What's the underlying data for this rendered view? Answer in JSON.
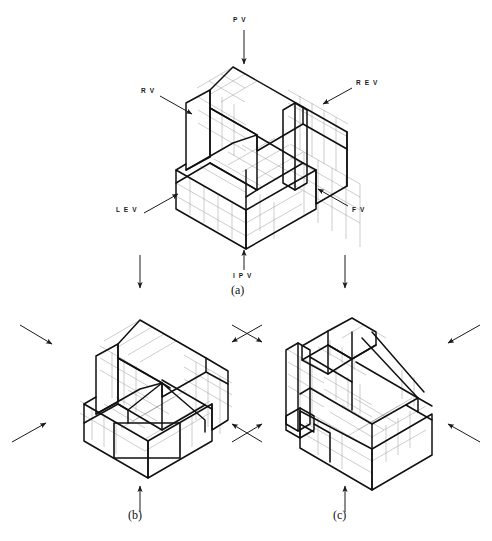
{
  "figure": {
    "background_color": "#ffffff",
    "line_color": "#1a1a1a",
    "grid_color": "#9a9a9a",
    "panels": [
      {
        "id": "panel-a",
        "caption": "(a)",
        "arrows": [
          {
            "name": "pv",
            "label": "P V",
            "direction": "down",
            "label_position": "top-center"
          },
          {
            "name": "rv",
            "label": "R V",
            "direction": "down-right",
            "label_position": "upper-left"
          },
          {
            "name": "rev",
            "label": "R E V",
            "direction": "down-left",
            "label_position": "upper-right"
          },
          {
            "name": "lev",
            "label": "L E V",
            "direction": "up-right",
            "label_position": "lower-left"
          },
          {
            "name": "fv",
            "label": "F V",
            "direction": "up-left",
            "label_position": "lower-right"
          },
          {
            "name": "ipv",
            "label": "I P V",
            "direction": "up",
            "label_position": "bottom-center"
          }
        ]
      },
      {
        "id": "panel-b",
        "caption": "(b)",
        "arrows": [
          {
            "name": "b-upper-left",
            "label": "",
            "direction": "down-right"
          },
          {
            "name": "b-upper-right",
            "label": "",
            "direction": "down-left"
          },
          {
            "name": "b-lower-left",
            "label": "",
            "direction": "up-right"
          },
          {
            "name": "b-lower-right",
            "label": "",
            "direction": "up-left"
          },
          {
            "name": "b-bottom",
            "label": "",
            "direction": "up"
          }
        ]
      },
      {
        "id": "panel-c",
        "caption": "(c)",
        "arrows": [
          {
            "name": "c-upper-left",
            "label": "",
            "direction": "down-right"
          },
          {
            "name": "c-upper-right",
            "label": "",
            "direction": "down-left"
          },
          {
            "name": "c-lower-left",
            "label": "",
            "direction": "up-right"
          },
          {
            "name": "c-lower-right",
            "label": "",
            "direction": "up-left"
          },
          {
            "name": "c-bottom",
            "label": "",
            "direction": "up"
          }
        ]
      }
    ],
    "connector_arrows": [
      {
        "name": "a-to-b-connector",
        "direction": "down",
        "label": ""
      },
      {
        "name": "a-to-c-connector",
        "direction": "down",
        "label": ""
      }
    ]
  },
  "labels": {
    "pv": "P V",
    "rv": "R V",
    "rev": "R E V",
    "lev": "L E V",
    "fv": "F V",
    "ipv": "I P V",
    "caption_a": "(a)",
    "caption_b": "(b)",
    "caption_c": "(c)"
  }
}
